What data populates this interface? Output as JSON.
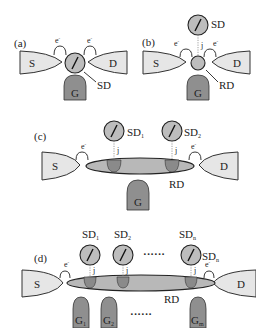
{
  "figure": {
    "panels": [
      {
        "id": "a",
        "label": "(a)",
        "source": "S",
        "drain": "D",
        "gate": "G",
        "dot_label": "SD",
        "tunnel_labels": [
          "e-",
          "e-"
        ]
      },
      {
        "id": "b",
        "label": "(b)",
        "source": "S",
        "drain": "D",
        "gate": "G",
        "spin_dot_label": "SD",
        "reg_dot_label": "RD",
        "coupling_label": "j",
        "tunnel_labels": [
          "e-",
          "e-"
        ]
      },
      {
        "id": "c",
        "label": "(c)",
        "source": "S",
        "drain": "D",
        "gate": "G",
        "reg_dot_label": "RD",
        "spin_dots": [
          {
            "label": "SD",
            "sub": "1",
            "coupling": "j"
          },
          {
            "label": "SD",
            "sub": "2",
            "coupling": "j"
          }
        ],
        "tunnel_labels": [
          "e-",
          "e-"
        ]
      },
      {
        "id": "d",
        "label": "(d)",
        "source": "S",
        "drain": "D",
        "reg_dot_label": "RD",
        "spin_dots": [
          {
            "label": "SD",
            "sub": "1",
            "coupling": "j"
          },
          {
            "label": "SD",
            "sub": "2",
            "coupling": "j"
          },
          {
            "label": "SD",
            "sub": "n",
            "coupling": "j"
          }
        ],
        "spin_dot_side_label": {
          "label": "SD",
          "sub": "n"
        },
        "ellipsis": "······",
        "gates": [
          {
            "label": "G",
            "sub": "1"
          },
          {
            "label": "G",
            "sub": "2"
          },
          {
            "label": "G",
            "sub": "m"
          }
        ],
        "tunnel_labels": [
          "e-",
          "e-"
        ]
      }
    ],
    "colors": {
      "lead_fill": "#e6e6e6",
      "dot_fill": "#bdbdbd",
      "gate_fill": "#8f8f8f",
      "outline": "#222222"
    }
  }
}
